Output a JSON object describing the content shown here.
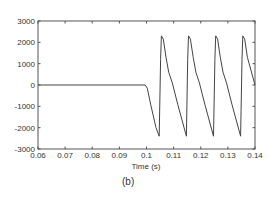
{
  "chart_data": {
    "type": "line",
    "title": "",
    "xlabel": "Time (s)",
    "ylabel": "",
    "xlim": [
      0.06,
      0.14
    ],
    "ylim": [
      -3000,
      3000
    ],
    "grid": false,
    "legend": null,
    "x_ticks": [
      "0.06",
      "0.07",
      "0.08",
      "0.09",
      "0.1",
      "0.11",
      "0.12",
      "0.13",
      "0.14"
    ],
    "y_ticks": [
      "3000",
      "2000",
      "1000",
      "0",
      "-1000",
      "-2000",
      "-3000"
    ],
    "series": [
      {
        "name": "signal",
        "x": [
          0.06,
          0.0995,
          0.1003,
          0.1015,
          0.1035,
          0.1047,
          0.1052,
          0.1055,
          0.1062,
          0.1072,
          0.1082,
          0.1095,
          0.1115,
          0.1147,
          0.1152,
          0.1155,
          0.1162,
          0.1172,
          0.1182,
          0.1195,
          0.1215,
          0.1247,
          0.1252,
          0.1255,
          0.1262,
          0.1272,
          0.1282,
          0.1295,
          0.1315,
          0.1347,
          0.1352,
          0.1355,
          0.1362,
          0.1372,
          0.14
        ],
        "values": [
          0,
          0,
          -150,
          -900,
          -2000,
          -2400,
          1200,
          2300,
          2150,
          1300,
          600,
          100,
          -900,
          -2400,
          1200,
          2300,
          2150,
          1300,
          600,
          100,
          -900,
          -2400,
          1200,
          2300,
          2150,
          1300,
          600,
          100,
          -900,
          -2400,
          1200,
          2300,
          2150,
          1300,
          0
        ]
      }
    ],
    "caption": "(b)"
  }
}
